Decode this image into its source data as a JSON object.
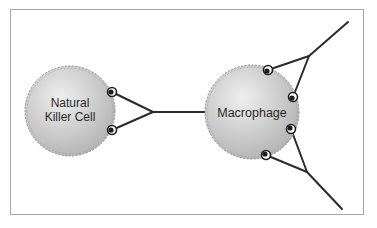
{
  "diagram": {
    "type": "cell-interaction",
    "colors": {
      "frame_border": "#a8a8a8",
      "cell_fill_light": "#eeeeee",
      "cell_fill_dark": "#b4b4b4",
      "cell_outline": "#888888",
      "line": "#2b2b2b",
      "text": "#2a2a2a"
    },
    "nodes": [
      {
        "id": "nk",
        "label_lines": [
          "Natural",
          "Killer Cell"
        ],
        "cx": 70,
        "cy": 111,
        "r": 45
      },
      {
        "id": "macrophage",
        "label_lines": [
          "Macrophage"
        ],
        "cx": 252,
        "cy": 112,
        "r": 47
      }
    ],
    "nk_cell": {
      "line1": "Natural",
      "line2": "Killer Cell"
    },
    "macrophage": {
      "label": "Macrophage"
    },
    "connections": [
      {
        "from": "nk",
        "to": "macrophage",
        "description": "NK cell receptors (2) converge to a single line connecting to macrophage"
      },
      {
        "from": "macrophage",
        "to": "upper-right",
        "description": "Two macrophage receptors converge to a line extending to upper right"
      },
      {
        "from": "macrophage",
        "to": "lower-right",
        "description": "Two macrophage receptors converge to a line extending to lower right"
      }
    ]
  }
}
